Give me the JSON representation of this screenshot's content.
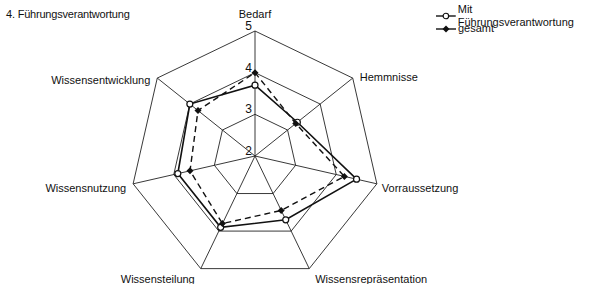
{
  "title": "4. Führungsverantwortung",
  "legend": [
    {
      "label": "Mit Führungsverantwortung",
      "marker": "open-circle",
      "line": "solid"
    },
    {
      "label": "gesamt",
      "marker": "filled-diamond",
      "line": "dashed"
    }
  ],
  "chart_data": {
    "type": "radar",
    "title": "4. Führungsverantwortung",
    "categories": [
      "Bedarf",
      "Hemmnisse",
      "Vorraussetzung",
      "Wissensrepräsentation",
      "Wissensteilung",
      "Wissensnutzung",
      "Wissensentwicklung"
    ],
    "series": [
      {
        "name": "Mit Führungsverantwortung",
        "values": [
          3.7,
          3.3,
          4.5,
          3.7,
          3.9,
          3.9,
          4.0
        ]
      },
      {
        "name": "gesamt",
        "values": [
          4.0,
          3.25,
          4.2,
          3.45,
          3.8,
          3.6,
          3.75
        ]
      }
    ],
    "rlim": [
      2,
      5
    ],
    "ticks": [
      2,
      3,
      4,
      5
    ],
    "grid": true,
    "legend_position": "top-right"
  }
}
